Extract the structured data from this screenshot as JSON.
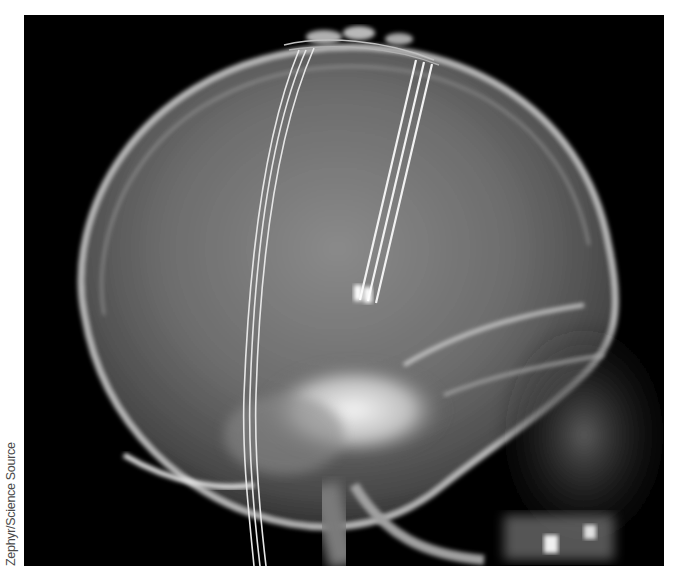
{
  "figure": {
    "credit": "Zephyr/Science Source",
    "colors": {
      "background": "#000000",
      "bone": "#d8d8d8",
      "soft": "#6a6a6a",
      "page": "#ffffff",
      "credit_text": "#4a4a4a"
    }
  }
}
